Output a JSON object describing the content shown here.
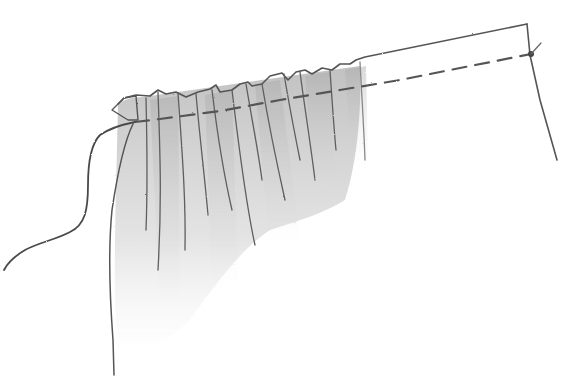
{
  "illustration": {
    "subject": "gathered fabric with running stitch",
    "style": "pencil sketch",
    "colors": {
      "background": "#ffffff",
      "line": "#5a5a5a",
      "line_dark": "#444444",
      "shade": "#9a9a9a"
    },
    "elements": {
      "fabric_top_edge": "wavy gathered top edge flattening into straight edge",
      "fabric_right_edge": "straight right edge",
      "stitch_line": "dashed running stitch",
      "knot": "anchoring knot at right corner",
      "thread_tail": "loose thread pulled to the left",
      "pleats": "vertical gathered folds with shading"
    }
  }
}
